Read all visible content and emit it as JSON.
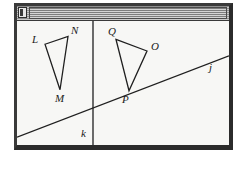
{
  "window": {
    "titlebar": {
      "icon_name": "window-menu-icon",
      "texture": "horizontal-stripes",
      "title": ""
    }
  },
  "chart_data": {
    "type": "diagram",
    "title": "",
    "background": "#f7f7f5",
    "stroke_color": "#1f1f1f",
    "coordinate_space": {
      "width": 212,
      "height": 128
    },
    "lines": [
      {
        "name": "j",
        "label": "j",
        "x1": 0,
        "y1": 120,
        "x2": 212,
        "y2": 36,
        "label_x": 192,
        "label_y": 52
      },
      {
        "name": "k",
        "label": "k",
        "x1": 76,
        "y1": 0,
        "x2": 76,
        "y2": 128,
        "label_x": 64,
        "label_y": 120
      }
    ],
    "polygons": [
      {
        "name": "triangle-LMN",
        "vertices": [
          {
            "label": "L",
            "x": 28,
            "y": 24,
            "label_x": 15,
            "label_y": 23
          },
          {
            "label": "N",
            "x": 51,
            "y": 16,
            "label_x": 54,
            "label_y": 13
          },
          {
            "label": "M",
            "x": 43,
            "y": 71,
            "label_x": 38,
            "label_y": 84
          }
        ]
      },
      {
        "name": "triangle-OPQ",
        "vertices": [
          {
            "label": "Q",
            "x": 99,
            "y": 19,
            "label_x": 91,
            "label_y": 14
          },
          {
            "label": "O",
            "x": 130,
            "y": 31,
            "label_x": 134,
            "label_y": 30
          },
          {
            "label": "P",
            "x": 112,
            "y": 72,
            "label_x": 105,
            "label_y": 85
          }
        ]
      }
    ]
  }
}
